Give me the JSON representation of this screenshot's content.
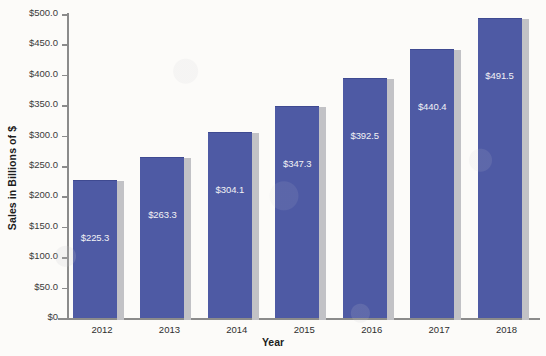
{
  "chart_data": {
    "type": "bar",
    "title": "",
    "xlabel": "Year",
    "ylabel": "Sales in Billions of $",
    "categories": [
      "2012",
      "2013",
      "2014",
      "2015",
      "2016",
      "2017",
      "2018"
    ],
    "values": [
      225.3,
      263.3,
      304.1,
      347.3,
      392.5,
      440.4,
      491.5
    ],
    "data_labels": [
      "$225.3",
      "$263.3",
      "$304.1",
      "$347.3",
      "$392.5",
      "$440.4",
      "$491.5"
    ],
    "ylim": [
      0,
      500
    ],
    "y_tick_step": 50,
    "y_tick_values": [
      0,
      50,
      100,
      150,
      200,
      250,
      300,
      350,
      400,
      450,
      500
    ],
    "y_tick_labels": [
      "$0",
      "$50.0",
      "$100.0",
      "$150.0",
      "$200.0",
      "$250.0",
      "$300.0",
      "$350.0",
      "$400.0",
      "$450.0",
      "$500.0"
    ],
    "grid": false,
    "legend": "none",
    "series": [
      {
        "name": "Sales",
        "values": [
          225.3,
          263.3,
          304.1,
          347.3,
          392.5,
          440.4,
          491.5
        ]
      }
    ],
    "colors": {
      "bar_fill": "#4e5aa4",
      "bar_shadow": "#c2c2c6",
      "axis_line": "#8b8b8b",
      "data_label_text": "#f2f2f5",
      "tick_label_text": "#3a3a3a",
      "background": "#fcfbf9"
    }
  }
}
